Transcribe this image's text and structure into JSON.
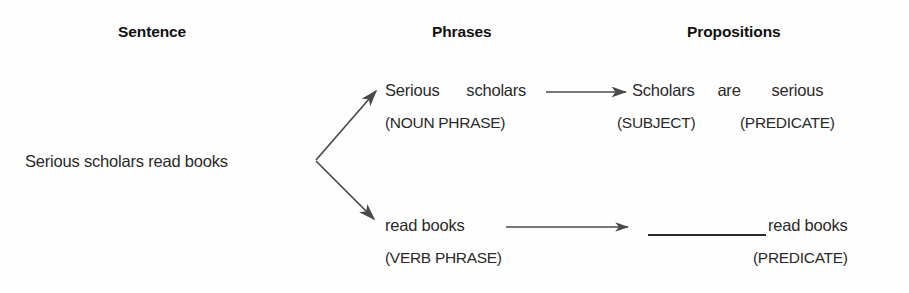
{
  "figure": {
    "background_color": "#fefefe",
    "ink_color": "#2a2a2a",
    "headers": [
      {
        "label": "Sentence"
      },
      {
        "label": "Phrases"
      },
      {
        "label": "Propositions"
      }
    ],
    "sentence": {
      "text": "Serious scholars read books"
    },
    "phrases": [
      {
        "words": [
          "Serious",
          "scholars"
        ],
        "category": "(NOUN PHRASE)"
      },
      {
        "words": [
          "read books"
        ],
        "category": "(VERB PHRASE)"
      }
    ],
    "propositions": [
      {
        "words": [
          "Scholars",
          "are",
          "serious"
        ],
        "roles": [
          "(SUBJECT)",
          "(PREDICATE)"
        ]
      },
      {
        "blank": "__________",
        "words": [
          "read books"
        ],
        "roles": [
          "(PREDICATE)"
        ]
      }
    ],
    "connectors": {
      "branch_from_sentence": "branching-arrow",
      "phrase_to_proposition_top": "arrow-right",
      "phrase_to_proposition_bottom": "arrow-right"
    }
  }
}
